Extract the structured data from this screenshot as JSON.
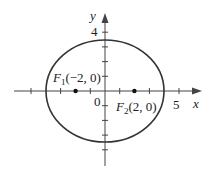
{
  "figure": {
    "type": "ellipse-diagram",
    "axes": {
      "x_label": "x",
      "y_label": "y",
      "origin_label": "0",
      "x_tick_label": "5",
      "y_tick_label": "4"
    },
    "ellipse": {
      "center": [
        0,
        0
      ],
      "semi_major_x": 4,
      "semi_minor_y": 3.46
    },
    "foci": [
      {
        "name": "F",
        "sub": "1",
        "coords": "(−2, 0)",
        "x": -2,
        "y": 0
      },
      {
        "name": "F",
        "sub": "2",
        "coords": "(2, 0)",
        "x": 2,
        "y": 0
      }
    ],
    "colors": {
      "stroke": "#333333",
      "axis": "#444444"
    }
  }
}
